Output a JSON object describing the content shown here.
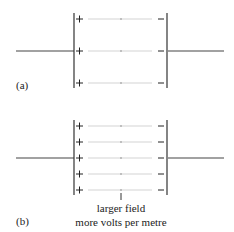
{
  "figure": {
    "panel_a": {
      "label": "(a)",
      "field_lines": 3,
      "plus_sign": "+",
      "minus_sign": "−"
    },
    "panel_b": {
      "label": "(b)",
      "field_lines": 5,
      "plus_sign": "+",
      "minus_sign": "−",
      "annotation_line1": "larger field",
      "annotation_line2": "more volts per metre"
    },
    "colors": {
      "plate": "#333333",
      "wire": "#444444",
      "field_line": "#c8c8c8"
    }
  }
}
